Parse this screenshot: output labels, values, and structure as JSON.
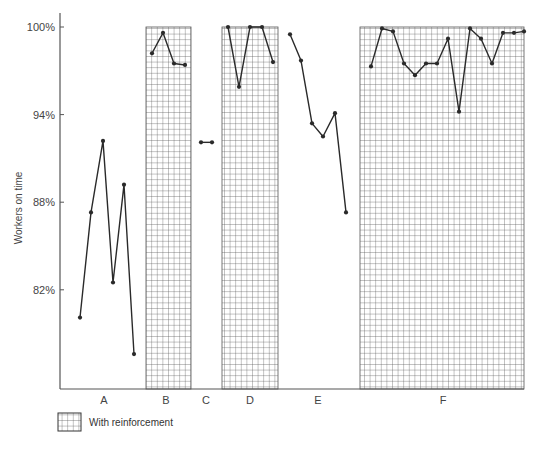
{
  "chart_data": {
    "type": "line",
    "title": "",
    "xlabel": "",
    "ylabel": "Workers on time",
    "ylim": [
      76,
      100
    ],
    "y_ticks": [
      "100%",
      "94%",
      "88%",
      "82%"
    ],
    "y_tick_values": [
      100,
      94,
      88,
      82
    ],
    "grid": false,
    "legend": {
      "position": "bottom-left",
      "entries": [
        {
          "label": "With reinforcement",
          "pattern": "grid-hatch"
        }
      ]
    },
    "phases": [
      {
        "label": "A",
        "reinforced": false,
        "values": [
          80.1,
          87.3,
          92.2,
          82.5,
          89.2,
          77.6
        ]
      },
      {
        "label": "B",
        "reinforced": true,
        "values": [
          98.2,
          99.6,
          97.5,
          97.4
        ]
      },
      {
        "label": "C",
        "reinforced": false,
        "values": [
          92.1,
          92.1
        ]
      },
      {
        "label": "D",
        "reinforced": true,
        "values": [
          100.0,
          95.9,
          100.0,
          100.0,
          97.6
        ]
      },
      {
        "label": "E",
        "reinforced": false,
        "values": [
          99.5,
          97.7,
          93.4,
          92.5,
          94.1,
          87.3
        ]
      },
      {
        "label": "F",
        "reinforced": true,
        "values": [
          97.3,
          99.9,
          99.7,
          97.5,
          96.7,
          97.5,
          97.5,
          99.2,
          94.2,
          99.9,
          99.2,
          97.5,
          99.6,
          99.6,
          99.7
        ]
      }
    ]
  },
  "layout": {
    "axis_x": 60,
    "axis_bottom": 389,
    "axis_right": 524,
    "y100_px": 27,
    "px_per_pct": 14.6,
    "phase_regions": [
      {
        "label": "A",
        "x0": 60,
        "x1": 146,
        "label_x": 104,
        "points_x": [
          80,
          91,
          103,
          113,
          124,
          134
        ]
      },
      {
        "label": "B",
        "x0": 146,
        "x1": 191,
        "label_x": 166,
        "points_x": [
          152,
          163,
          174,
          185
        ]
      },
      {
        "label": "C",
        "x0": 191,
        "x1": 222,
        "label_x": 206,
        "points_x": [
          201,
          212
        ]
      },
      {
        "label": "D",
        "x0": 222,
        "x1": 278,
        "label_x": 250,
        "points_x": [
          228,
          239,
          250,
          262,
          273
        ]
      },
      {
        "label": "E",
        "x0": 278,
        "x1": 360,
        "label_x": 318,
        "points_x": [
          290,
          301,
          312,
          323,
          335,
          346
        ]
      },
      {
        "label": "F",
        "x0": 360,
        "x1": 524,
        "label_x": 443,
        "points_x": [
          371,
          382,
          393,
          404,
          415,
          426,
          437,
          448,
          459,
          470,
          481,
          492,
          503,
          514,
          524
        ]
      }
    ]
  },
  "colors": {
    "line": "#2a2a2a",
    "axis": "#555555",
    "hatch": "#555555",
    "text": "#444444"
  }
}
